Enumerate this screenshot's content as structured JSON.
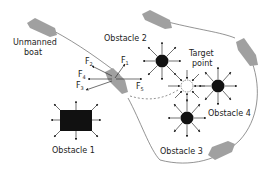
{
  "diagram": {
    "type": "artificial-potential-field-path-planning",
    "labels": {
      "boat": "Unmanned",
      "boat_line2": "boat",
      "obstacle1": "Obstacle 1",
      "obstacle2": "Obstacle 2",
      "obstacle3": "Obstacle 3",
      "obstacle4": "Obstacle 4",
      "target": "Target",
      "target_line2": "point"
    },
    "forces": [
      {
        "base": "F",
        "sub": "1"
      },
      {
        "base": "F",
        "sub": "2"
      },
      {
        "base": "F",
        "sub": "4"
      },
      {
        "base": "F",
        "sub": "3"
      },
      {
        "base": "F",
        "sub": "5"
      }
    ],
    "colors": {
      "boat": "#a0a0a0",
      "obstacle": "#111111",
      "line": "#555555",
      "target_fill": "#ffffff"
    }
  }
}
